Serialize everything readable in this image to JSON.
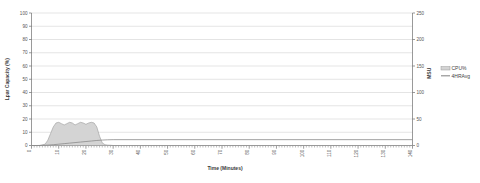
{
  "chart_data": {
    "type": "area",
    "title": "",
    "xlabel": "Time (Minutes)",
    "ylabel": "Lpar Capacity (%)",
    "y2label": "MSU",
    "xlim": [
      0,
      140
    ],
    "ylim": [
      0,
      100
    ],
    "y2lim": [
      0,
      250
    ],
    "grid": true,
    "legend_position": "right",
    "xticks": [
      "0",
      "10",
      "20",
      "30",
      "40",
      "50",
      "60",
      "70",
      "80",
      "90",
      "100",
      "110",
      "120",
      "130",
      "140"
    ],
    "xtick_values": [
      0,
      10,
      20,
      30,
      40,
      50,
      60,
      70,
      80,
      90,
      100,
      110,
      120,
      130,
      140
    ],
    "yticks": [
      "0",
      "10",
      "20",
      "30",
      "40",
      "50",
      "60",
      "70",
      "80",
      "90",
      "100"
    ],
    "ytick_values": [
      0,
      10,
      20,
      30,
      40,
      50,
      60,
      70,
      80,
      90,
      100
    ],
    "y2ticks": [
      "0",
      "50",
      "100",
      "150",
      "200",
      "250"
    ],
    "y2tick_values": [
      0,
      50,
      100,
      150,
      200,
      250
    ],
    "minor_tick_interval": 1,
    "colors": {
      "cpu_fill": "#d4d4d4",
      "cpu_stroke": "#9a9a9a",
      "avg_line": "#8a8a8a",
      "grid": "#c9c9c9",
      "axis": "#6e6e6e"
    },
    "series": [
      {
        "name": "CPU%",
        "style": "area",
        "axis": "left",
        "x": [
          0,
          1,
          2,
          3,
          4,
          5,
          6,
          7,
          8,
          9,
          10,
          11,
          12,
          13,
          14,
          15,
          16,
          17,
          18,
          19,
          20,
          21,
          22,
          23,
          24,
          25,
          26,
          27,
          28,
          29,
          30,
          140
        ],
        "values": [
          0,
          0,
          0,
          0,
          0.5,
          1,
          4,
          9,
          14,
          17,
          17.5,
          16.5,
          15.5,
          16.5,
          17.5,
          17,
          15.5,
          16.5,
          17.5,
          17,
          16,
          17,
          17.5,
          17,
          14,
          7,
          2,
          0.6,
          0.3,
          0.2,
          0,
          0
        ]
      },
      {
        "name": "4HRAvg",
        "style": "line",
        "axis": "left",
        "x": [
          0,
          2,
          4,
          6,
          8,
          10,
          12,
          14,
          16,
          18,
          20,
          22,
          24,
          26,
          28,
          30,
          140
        ],
        "values": [
          0,
          0,
          0.1,
          0.3,
          0.6,
          1.0,
          1.4,
          1.8,
          2.2,
          2.6,
          3.0,
          3.4,
          3.8,
          4.1,
          4.3,
          4.4,
          4.4
        ]
      }
    ],
    "legend": [
      {
        "label": "CPU%",
        "marker": "area-swatch"
      },
      {
        "label": "4HRAvg",
        "marker": "line-swatch"
      }
    ]
  }
}
